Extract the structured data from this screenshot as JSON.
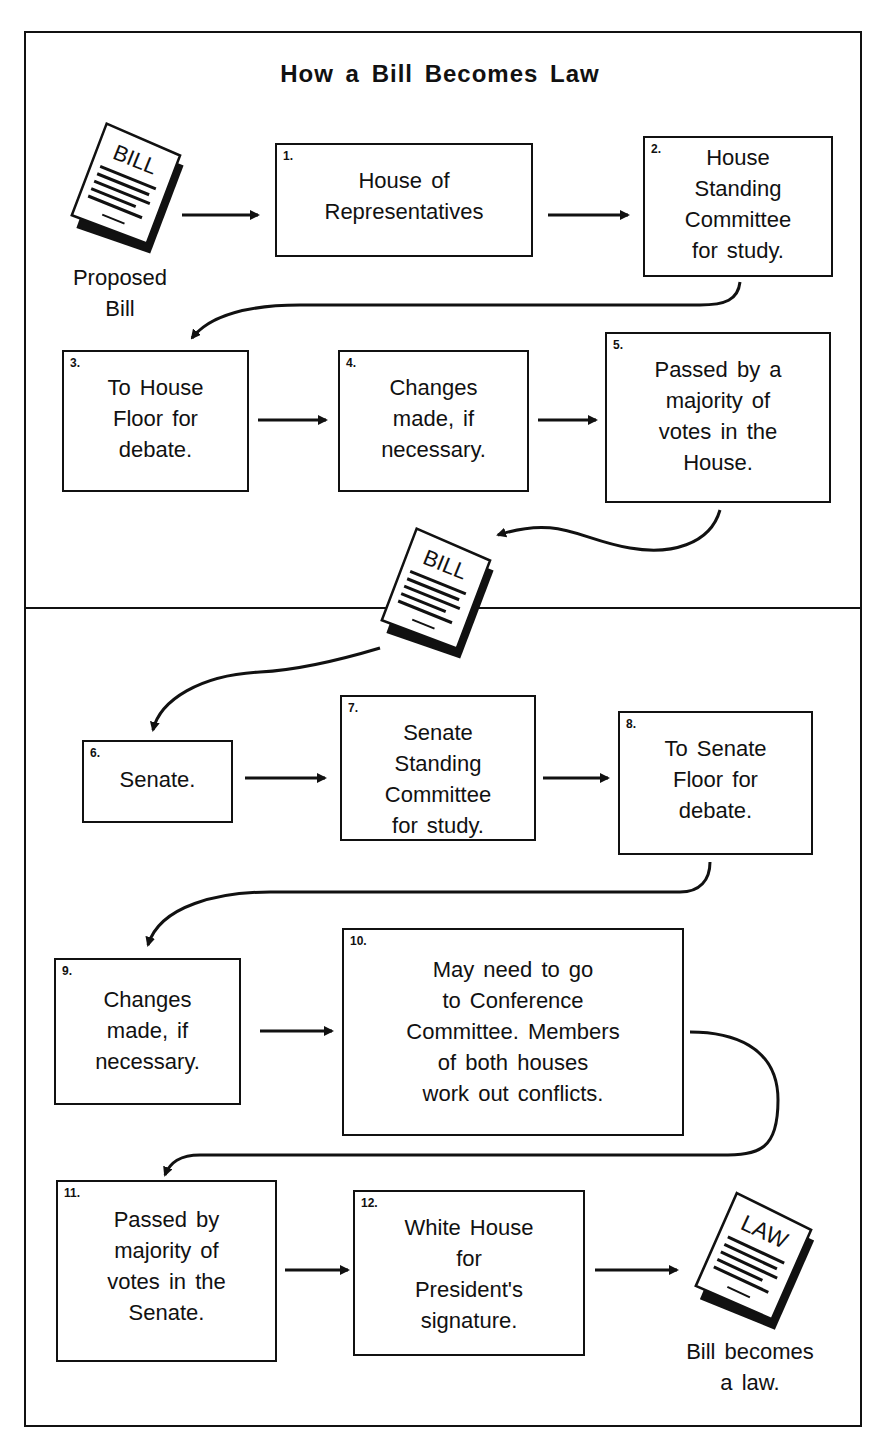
{
  "title": "How a Bill Becomes Law",
  "start": {
    "icon": "bill-document-icon",
    "icon_label": "BILL",
    "caption": "Proposed\nBill"
  },
  "house_steps": [
    {
      "num": "1.",
      "text": "House of\nRepresentatives"
    },
    {
      "num": "2.",
      "text": "House\nStanding\nCommittee\nfor study."
    },
    {
      "num": "3.",
      "text": "To House\nFloor for\ndebate."
    },
    {
      "num": "4.",
      "text": "Changes\nmade, if\nnecessary."
    },
    {
      "num": "5.",
      "text": "Passed by a\nmajority of\nvotes in the\nHouse."
    }
  ],
  "transfer": {
    "icon": "bill-document-icon",
    "icon_label": "BILL"
  },
  "senate_steps": [
    {
      "num": "6.",
      "text": "Senate."
    },
    {
      "num": "7.",
      "text": "Senate\nStanding\nCommittee\nfor study."
    },
    {
      "num": "8.",
      "text": "To Senate\nFloor for\ndebate."
    },
    {
      "num": "9.",
      "text": "Changes\nmade, if\nnecessary."
    },
    {
      "num": "10.",
      "text": "May need to go\nto Conference\nCommittee.  Members\nof both houses\nwork out conflicts."
    },
    {
      "num": "11.",
      "text": "Passed by\nmajority of\nvotes in the\nSenate."
    },
    {
      "num": "12.",
      "text": "White House\nfor\nPresident's\nsignature."
    }
  ],
  "end": {
    "icon": "law-document-icon",
    "icon_label": "LAW",
    "caption": "Bill becomes\na law."
  },
  "colors": {
    "ink": "#111111",
    "paper": "#ffffff"
  }
}
